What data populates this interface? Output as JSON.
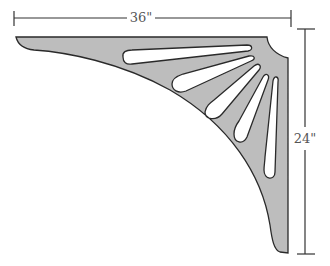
{
  "diagram": {
    "colors": {
      "fill": "#bdbdbd",
      "outline": "#2a2a2a",
      "dimension_line": "#333333",
      "background": "#ffffff"
    },
    "dimensions": {
      "width_label": "36\"",
      "height_label": "24\""
    },
    "slot_count": 5
  }
}
